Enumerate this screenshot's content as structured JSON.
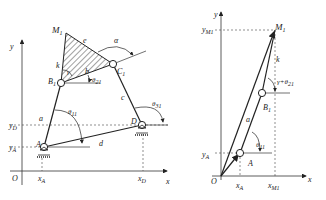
{
  "left_diagram": {
    "points": {
      "M": "M",
      "M_sub": "1",
      "B": "B",
      "B_sub": "1",
      "C": "C",
      "C_sub": "1",
      "A": "A",
      "D": "D",
      "O": "O"
    },
    "links": {
      "a": "a",
      "b": "b",
      "c": "c",
      "d": "d",
      "e": "e",
      "k": "k"
    },
    "angles": {
      "alpha": "α",
      "gamma": "γ",
      "theta2": "θ",
      "theta2_sub": "21",
      "theta1": "θ",
      "theta1_sub": "11",
      "theta3": "θ",
      "theta3_sub": "31"
    },
    "axes": {
      "x": "x",
      "y": "y",
      "yD": "y",
      "yD_sub": "D",
      "yA": "y",
      "yA_sub": "A",
      "xA": "x",
      "xA_sub": "A",
      "xD": "x",
      "xD_sub": "D"
    }
  },
  "right_diagram": {
    "points": {
      "M": "M",
      "M_sub": "1",
      "B": "B",
      "B_sub": "1",
      "A": "A",
      "O": "O"
    },
    "links": {
      "a": "a",
      "k": "k"
    },
    "angles": {
      "gamma_theta": "γ+θ",
      "gamma_theta_sub": "21",
      "theta1": "θ",
      "theta1_sub": "11"
    },
    "axes": {
      "x": "x",
      "y": "y",
      "yM": "y",
      "yM_sub": "M1",
      "yA": "y",
      "yA_sub": "A",
      "xA": "x",
      "xA_sub": "A",
      "xM": "x",
      "xM_sub": "M1"
    }
  }
}
